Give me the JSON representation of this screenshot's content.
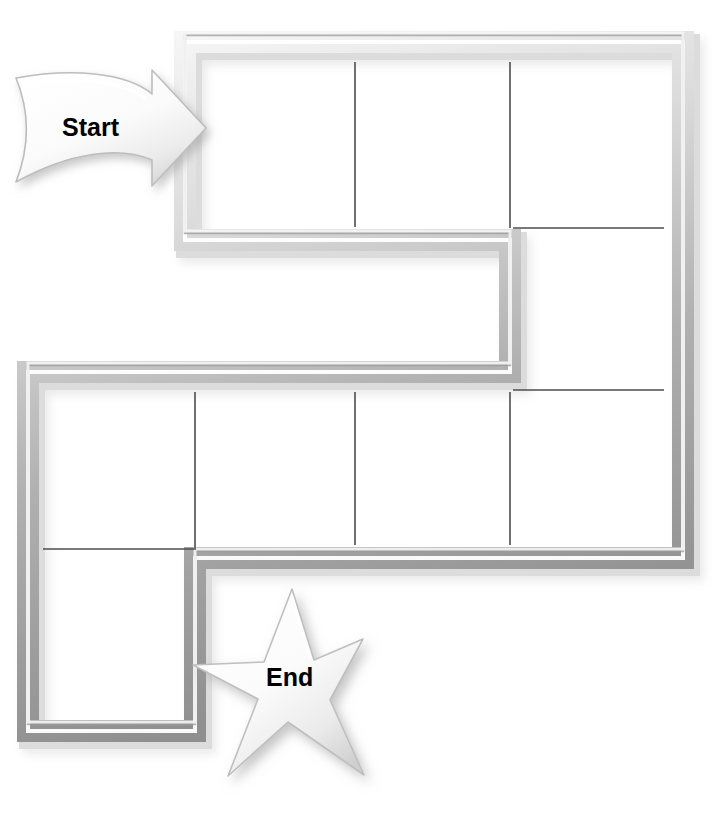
{
  "page": {
    "background_color": "#ffffff",
    "width": 723,
    "height": 818
  },
  "board": {
    "name": "winding-path-board",
    "description": "Serpentine board-game track drawn as a thick embossed gray channel subdivided into square cells by thin lines.",
    "path_fill_color": "#ffffff",
    "path_border_light": "#f2f2f2",
    "path_border_mid": "#c9c9c9",
    "path_border_dark": "#8a8a8a",
    "cell_divider_color": "#4d4d4d",
    "cell_divider_width": 1.6,
    "border_thickness": 13,
    "shadow_color": "rgba(120,120,120,0.45)",
    "outline": [
      [
        185,
        42
      ],
      [
        683,
        42
      ],
      [
        683,
        558
      ],
      [
        195,
        558
      ],
      [
        195,
        731
      ],
      [
        28,
        731
      ],
      [
        28,
        372
      ],
      [
        510,
        372
      ],
      [
        510,
        240
      ],
      [
        185,
        240
      ]
    ],
    "cell_dividers": [
      {
        "name": "divider-top-1",
        "x1": 355,
        "y1": 62,
        "x2": 355,
        "y2": 227
      },
      {
        "name": "divider-top-2",
        "x1": 510,
        "y1": 62,
        "x2": 510,
        "y2": 228
      },
      {
        "name": "divider-right-1",
        "x1": 513,
        "y1": 228,
        "x2": 664,
        "y2": 228
      },
      {
        "name": "divider-right-2",
        "x1": 513,
        "y1": 390,
        "x2": 664,
        "y2": 390
      },
      {
        "name": "divider-bottom-1",
        "x1": 195,
        "y1": 392,
        "x2": 195,
        "y2": 548
      },
      {
        "name": "divider-bottom-2",
        "x1": 355,
        "y1": 392,
        "x2": 355,
        "y2": 545
      },
      {
        "name": "divider-bottom-3",
        "x1": 510,
        "y1": 392,
        "x2": 510,
        "y2": 545
      },
      {
        "name": "divider-bottom-left",
        "x1": 43,
        "y1": 549,
        "x2": 196,
        "y2": 549
      }
    ],
    "cell_count": 11
  },
  "start_marker": {
    "name": "start-arrow",
    "label": "Start",
    "shape": "curved-right-arrow",
    "label_color": "#000000",
    "fill_color": "#ffffff",
    "edge_color": "#b4b4b4",
    "bounds": {
      "x": 10,
      "y": 70,
      "width": 196,
      "height": 118
    }
  },
  "end_marker": {
    "name": "end-star",
    "label": "End",
    "shape": "five-point-star",
    "label_color": "#000000",
    "fill_color": "#ffffff",
    "edge_color": "#b4b4b4",
    "bounds": {
      "x": 192,
      "y": 588,
      "width": 172,
      "height": 188
    }
  }
}
